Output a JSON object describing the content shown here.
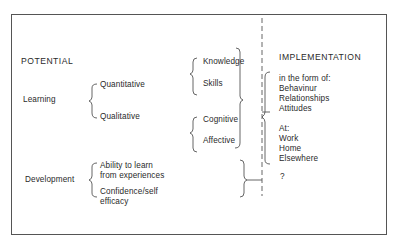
{
  "diagram": {
    "potential": {
      "heading": "POTENTIAL",
      "learning": {
        "label": "Learning",
        "branches": [
          "Quantitative",
          "Qualitative"
        ],
        "quantitative_items": [
          "Knowledge",
          "Skills"
        ],
        "qualitative_items": [
          "Cognitive",
          "Affective"
        ]
      },
      "development": {
        "label": "Development",
        "items": [
          "Ability to learn",
          "from experiences",
          "Confidence/self",
          "efficacy"
        ]
      }
    },
    "implementation": {
      "heading": "IMPLEMENTATION",
      "form_intro": "in the form of:",
      "forms": [
        "Behavinur",
        "Relationships",
        "Attitudes"
      ],
      "location_intro": "At:",
      "locations": [
        "Work",
        "Home",
        "Elsewhere"
      ],
      "unknown": "?"
    }
  },
  "colors": {
    "ink": "#2a2a2a",
    "line": "#555555",
    "background": "#ffffff"
  }
}
